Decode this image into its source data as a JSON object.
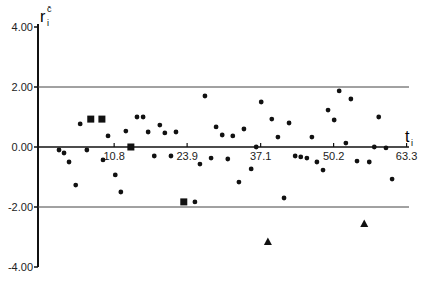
{
  "chart_data": {
    "type": "scatter",
    "title": "",
    "ylabel": "r_i^c",
    "xlabel": "t_i",
    "ylim": [
      -4.0,
      4.0
    ],
    "xlim": [
      0,
      63.3
    ],
    "y_ticks": [
      "4.00",
      "2.00",
      "0.00",
      "-2.00",
      "-4.00"
    ],
    "x_ticks": [
      "10.8",
      "23.9",
      "37.1",
      "50.2",
      "63.3"
    ],
    "reference_lines": [
      2.0,
      -2.0
    ],
    "grid": false,
    "legend": null,
    "series": [
      {
        "name": "circles",
        "marker": "circle",
        "points": [
          [
            0.9,
            -0.1
          ],
          [
            1.8,
            -0.2
          ],
          [
            2.7,
            -0.5
          ],
          [
            3.9,
            -1.27
          ],
          [
            4.7,
            0.77
          ],
          [
            5.9,
            -0.1
          ],
          [
            8.8,
            -0.43
          ],
          [
            9.7,
            0.37
          ],
          [
            11.0,
            -0.93
          ],
          [
            12.0,
            -1.5
          ],
          [
            12.9,
            0.53
          ],
          [
            14.9,
            1.0
          ],
          [
            16.0,
            1.0
          ],
          [
            16.9,
            0.5
          ],
          [
            18.0,
            -0.3
          ],
          [
            19.0,
            0.73
          ],
          [
            19.9,
            0.47
          ],
          [
            21.0,
            -0.3
          ],
          [
            21.9,
            0.5
          ],
          [
            25.3,
            -1.83
          ],
          [
            26.2,
            -0.57
          ],
          [
            27.1,
            1.7
          ],
          [
            28.2,
            -0.37
          ],
          [
            29.1,
            0.67
          ],
          [
            30.2,
            0.4
          ],
          [
            31.2,
            -0.4
          ],
          [
            32.1,
            0.37
          ],
          [
            33.2,
            -1.17
          ],
          [
            34.1,
            0.6
          ],
          [
            35.4,
            -0.73
          ],
          [
            36.3,
            0.0
          ],
          [
            37.2,
            1.5
          ],
          [
            39.1,
            0.93
          ],
          [
            40.2,
            0.33
          ],
          [
            41.3,
            -1.7
          ],
          [
            42.2,
            0.8
          ],
          [
            43.3,
            -0.3
          ],
          [
            44.3,
            -0.33
          ],
          [
            45.4,
            -0.37
          ],
          [
            46.3,
            0.33
          ],
          [
            47.2,
            -0.5
          ],
          [
            48.3,
            -0.77
          ],
          [
            49.2,
            1.23
          ],
          [
            50.3,
            0.9
          ],
          [
            51.2,
            1.87
          ],
          [
            52.4,
            0.13
          ],
          [
            53.3,
            1.6
          ],
          [
            54.4,
            -0.47
          ],
          [
            56.6,
            -0.5
          ],
          [
            57.5,
            0.0
          ],
          [
            58.3,
            1.0
          ],
          [
            59.6,
            -0.03
          ],
          [
            60.7,
            -1.07
          ]
        ]
      },
      {
        "name": "squares",
        "marker": "square",
        "points": [
          [
            6.6,
            0.93
          ],
          [
            8.6,
            0.93
          ],
          [
            13.8,
            0.0
          ],
          [
            23.3,
            -1.83
          ]
        ]
      },
      {
        "name": "triangles",
        "marker": "triangle",
        "points": [
          [
            38.4,
            -3.17
          ],
          [
            55.7,
            -2.57
          ]
        ]
      }
    ]
  }
}
